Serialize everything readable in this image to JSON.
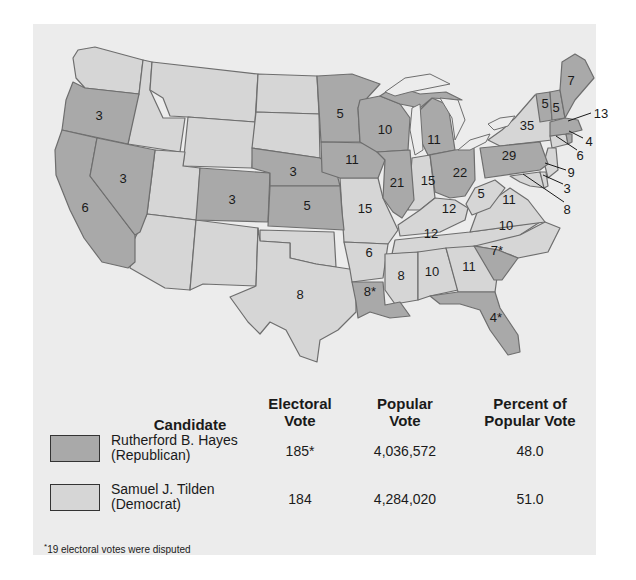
{
  "colors": {
    "republican": "#a9a9a9",
    "democrat": "#d6d6d6",
    "background": "#ececec",
    "border": "#6e6e6e"
  },
  "map": {
    "states": [
      {
        "state": "Oregon",
        "votes": "3",
        "party": "republican"
      },
      {
        "state": "California",
        "votes": "6",
        "party": "republican"
      },
      {
        "state": "Nevada",
        "votes": "3",
        "party": "republican"
      },
      {
        "state": "Colorado",
        "votes": "3",
        "party": "republican"
      },
      {
        "state": "Nebraska",
        "votes": "3",
        "party": "republican"
      },
      {
        "state": "Kansas",
        "votes": "5",
        "party": "republican"
      },
      {
        "state": "Texas",
        "votes": "8",
        "party": "democrat"
      },
      {
        "state": "Minnesota",
        "votes": "5",
        "party": "republican"
      },
      {
        "state": "Iowa",
        "votes": "11",
        "party": "republican"
      },
      {
        "state": "Missouri",
        "votes": "15",
        "party": "democrat"
      },
      {
        "state": "Arkansas",
        "votes": "6",
        "party": "democrat"
      },
      {
        "state": "Louisiana",
        "votes": "8*",
        "party": "republican"
      },
      {
        "state": "Wisconsin",
        "votes": "10",
        "party": "republican"
      },
      {
        "state": "Illinois",
        "votes": "21",
        "party": "republican"
      },
      {
        "state": "Michigan",
        "votes": "11",
        "party": "republican"
      },
      {
        "state": "Indiana",
        "votes": "15",
        "party": "democrat"
      },
      {
        "state": "Ohio",
        "votes": "22",
        "party": "republican"
      },
      {
        "state": "Kentucky",
        "votes": "12",
        "party": "democrat"
      },
      {
        "state": "Tennessee",
        "votes": "12",
        "party": "democrat"
      },
      {
        "state": "Mississippi",
        "votes": "8",
        "party": "democrat"
      },
      {
        "state": "Alabama",
        "votes": "10",
        "party": "democrat"
      },
      {
        "state": "Georgia",
        "votes": "11",
        "party": "democrat"
      },
      {
        "state": "Florida",
        "votes": "4*",
        "party": "republican"
      },
      {
        "state": "South Carolina",
        "votes": "7*",
        "party": "republican"
      },
      {
        "state": "North Carolina",
        "votes": "10",
        "party": "democrat"
      },
      {
        "state": "Virginia",
        "votes": "11",
        "party": "democrat"
      },
      {
        "state": "West Virginia",
        "votes": "5",
        "party": "democrat"
      },
      {
        "state": "Pennsylvania",
        "votes": "29",
        "party": "republican"
      },
      {
        "state": "New York",
        "votes": "35",
        "party": "democrat"
      },
      {
        "state": "Vermont",
        "votes": "5",
        "party": "republican"
      },
      {
        "state": "New Hampshire",
        "votes": "5",
        "party": "republican"
      },
      {
        "state": "Maine",
        "votes": "7",
        "party": "republican"
      },
      {
        "state": "Massachusetts",
        "votes": "13",
        "party": "republican"
      },
      {
        "state": "Rhode Island",
        "votes": "4",
        "party": "republican"
      },
      {
        "state": "Connecticut",
        "votes": "6",
        "party": "democrat"
      },
      {
        "state": "New Jersey",
        "votes": "9",
        "party": "democrat"
      },
      {
        "state": "Delaware",
        "votes": "3",
        "party": "democrat"
      },
      {
        "state": "Maryland",
        "votes": "8",
        "party": "democrat"
      }
    ]
  },
  "table": {
    "headers": {
      "candidate": "Candidate",
      "electoral_1": "Electoral",
      "electoral_2": "Vote",
      "popular_1": "Popular",
      "popular_2": "Vote",
      "percent_1": "Percent of",
      "percent_2": "Popular Vote"
    },
    "rows": [
      {
        "name": "Rutherford B. Hayes",
        "party": "(Republican)",
        "electoral": "185*",
        "popular": "4,036,572",
        "percent": "48.0"
      },
      {
        "name": "Samuel J. Tilden",
        "party": "(Democrat)",
        "electoral": "184",
        "popular": "4,284,020",
        "percent": "51.0"
      }
    ]
  },
  "footnote": {
    "mark": "*",
    "text": "19 electoral votes were disputed"
  }
}
